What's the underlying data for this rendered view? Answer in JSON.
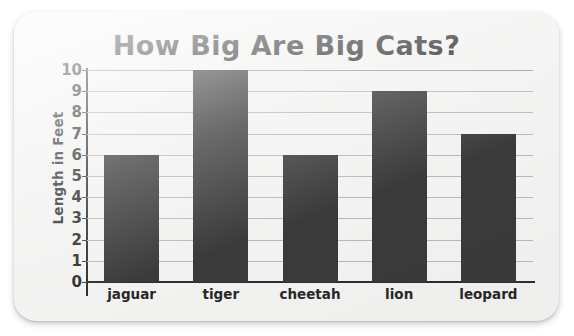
{
  "chart_data": {
    "type": "bar",
    "title": "How Big Are Big Cats?",
    "xlabel": "",
    "ylabel": "Length in Feet",
    "categories": [
      "jaguar",
      "tiger",
      "cheetah",
      "lion",
      "leopard"
    ],
    "values": [
      6,
      10,
      6,
      9,
      7
    ],
    "ylim": [
      0,
      10
    ],
    "ytick_labels": [
      "10",
      "9",
      "8",
      "7",
      "6",
      "5",
      "4",
      "3",
      "2",
      "1",
      "0"
    ],
    "ytick_values": [
      10,
      9,
      8,
      7,
      6,
      5,
      4,
      3,
      2,
      1,
      0
    ],
    "grid": true,
    "legend": false,
    "bar_color": "#3a3a3a",
    "grid_color": "#b9b9b9",
    "axis_color": "#2e2e2e",
    "background_color": "#f2f2f1",
    "text_color": "#2b2b2b"
  }
}
